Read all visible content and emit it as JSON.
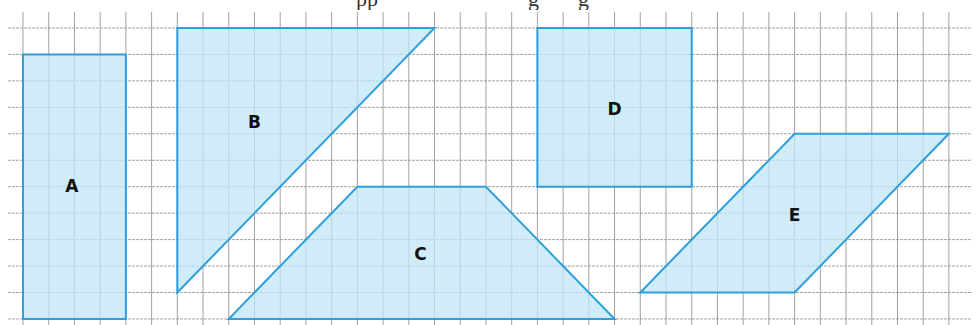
{
  "header": {
    "clipped_text_fragments": [
      "pp",
      "g",
      "g"
    ]
  },
  "grid": {
    "columns": 36,
    "rows": 11,
    "line_color": "#8a8a8a"
  },
  "style": {
    "fill_color": "#bfe6f5",
    "stroke_color": "#2e9fdc"
  },
  "shapes": [
    {
      "id": "A",
      "label": "A",
      "type": "rectangle",
      "vertices": [
        [
          0,
          1
        ],
        [
          4,
          1
        ],
        [
          4,
          11
        ],
        [
          0,
          11
        ]
      ],
      "label_at": [
        1.9,
        6.0
      ]
    },
    {
      "id": "B",
      "label": "B",
      "type": "right-triangle",
      "vertices": [
        [
          6,
          0
        ],
        [
          16,
          0
        ],
        [
          6,
          10
        ]
      ],
      "label_at": [
        9.0,
        3.6
      ]
    },
    {
      "id": "C",
      "label": "C",
      "type": "trapezoid",
      "vertices": [
        [
          13,
          6
        ],
        [
          18,
          6
        ],
        [
          23,
          11
        ],
        [
          8,
          11
        ]
      ],
      "label_at": [
        15.45,
        8.6
      ]
    },
    {
      "id": "D",
      "label": "D",
      "type": "rectangle",
      "vertices": [
        [
          20,
          0
        ],
        [
          26,
          0
        ],
        [
          26,
          6
        ],
        [
          20,
          6
        ]
      ],
      "label_at": [
        23.0,
        3.1
      ]
    },
    {
      "id": "E",
      "label": "E",
      "type": "parallelogram",
      "vertices": [
        [
          30,
          4
        ],
        [
          36,
          4
        ],
        [
          30,
          10
        ],
        [
          24,
          10
        ]
      ],
      "label_at": [
        30.0,
        7.1
      ]
    }
  ]
}
